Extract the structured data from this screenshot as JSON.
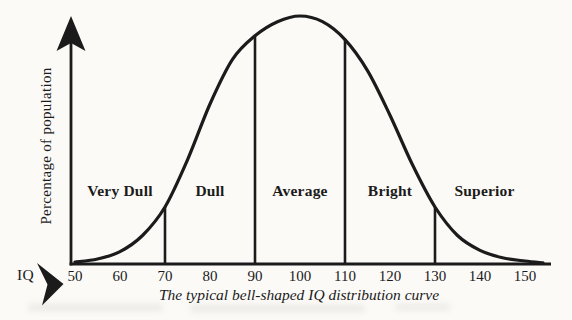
{
  "figure": {
    "background": "#fbfaf7",
    "ink": "#1b1b1b"
  },
  "chart_data": {
    "type": "area",
    "caption": "The typical bell-shaped IQ distribution curve",
    "xlabel": "IQ",
    "ylabel": "Percentage of population",
    "x_ticks": [
      50,
      60,
      70,
      80,
      90,
      100,
      110,
      120,
      130,
      140,
      150
    ],
    "x_range": [
      50,
      155
    ],
    "grid": "off",
    "curve": {
      "x": [
        50,
        55,
        60,
        65,
        70,
        75,
        80,
        85,
        90,
        95,
        100,
        105,
        110,
        115,
        120,
        125,
        130,
        135,
        140,
        145,
        150,
        154
      ],
      "rel_height": [
        0.008,
        0.02,
        0.05,
        0.115,
        0.23,
        0.42,
        0.645,
        0.825,
        0.92,
        0.977,
        1.0,
        0.977,
        0.905,
        0.78,
        0.6,
        0.4,
        0.23,
        0.115,
        0.055,
        0.025,
        0.012,
        0.005
      ]
    },
    "dividers": [
      70,
      90,
      110,
      130
    ],
    "regions": [
      {
        "label": "Very Dull",
        "from": 50,
        "to": 70
      },
      {
        "label": "Dull",
        "from": 70,
        "to": 90
      },
      {
        "label": "Average",
        "from": 90,
        "to": 110
      },
      {
        "label": "Bright",
        "from": 110,
        "to": 130
      },
      {
        "label": "Superior",
        "from": 130,
        "to": 152
      }
    ]
  }
}
